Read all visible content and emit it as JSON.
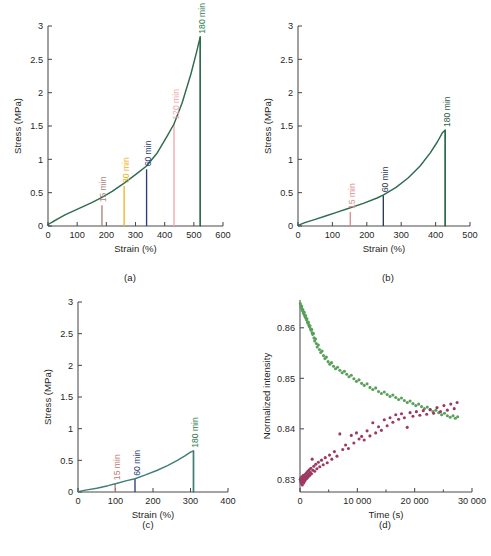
{
  "figure": {
    "background": "#ffffff",
    "panels": [
      "a",
      "b",
      "c",
      "d"
    ]
  },
  "captions": {
    "a": "(a)",
    "b": "(b)",
    "c": "(c)",
    "d": "(d)"
  },
  "colors": {
    "curve_green": "#2f6b4f",
    "curve_teal": "#3f7f78",
    "t15": "#a8847e",
    "t15_b": "#d98d8d",
    "t15_c": "#c07a74",
    "t30": "#f0b323",
    "t60": "#2c3d77",
    "t60_b": "#2a3a52",
    "t120": "#f2a7ad",
    "t180": "#2f7d4f",
    "t180_b": "#2f5d4a",
    "scatter_green": "#59a05a",
    "scatter_magenta": "#9c3a63",
    "axis": "#4a4a4a"
  },
  "chart_data": [
    {
      "id": "a",
      "type": "line",
      "title": "",
      "xlabel": "Strain (%)",
      "ylabel": "Stress (MPa)",
      "xlim": [
        0,
        600
      ],
      "ylim": [
        0,
        3
      ],
      "xticks": [
        0,
        100,
        200,
        300,
        400,
        500,
        600
      ],
      "xticklabels": [
        "0",
        "100",
        "200",
        "300",
        "400",
        "500",
        "600"
      ],
      "yticks": [
        0,
        0.5,
        1,
        1.5,
        2,
        2.5,
        3
      ],
      "yticklabels": [
        "0",
        "0.5",
        "1",
        "1.5",
        "2",
        "2.5",
        "3"
      ],
      "grid": false,
      "legend": "none",
      "series": [
        {
          "name": "stress-strain master curve",
          "color": "#2f6b4f",
          "x": [
            0,
            15,
            35,
            60,
            90,
            120,
            150,
            185,
            220,
            260,
            300,
            338,
            375,
            410,
            432,
            460,
            490,
            510,
            522
          ],
          "y": [
            0.02,
            0.06,
            0.11,
            0.17,
            0.23,
            0.29,
            0.35,
            0.43,
            0.52,
            0.64,
            0.77,
            0.9,
            1.1,
            1.36,
            1.53,
            1.85,
            2.28,
            2.62,
            2.84
          ]
        }
      ],
      "drop_x": 522,
      "annotations": [
        {
          "label": "15 min",
          "x": 185,
          "y": 0.31,
          "color": "#a8847e"
        },
        {
          "label": "30 min",
          "x": 261,
          "y": 0.6,
          "color": "#f0b323"
        },
        {
          "label": "60 min",
          "x": 338,
          "y": 0.85,
          "color": "#2c3d77"
        },
        {
          "label": "120 min",
          "x": 432,
          "y": 1.55,
          "color": "#f2a7ad"
        },
        {
          "label": "180 min",
          "x": 522,
          "y": 2.84,
          "color": "#2f7d4f"
        }
      ]
    },
    {
      "id": "b",
      "type": "line",
      "title": "",
      "xlabel": "Strain (%)",
      "ylabel": "Stress (MPa)",
      "xlim": [
        0,
        500
      ],
      "ylim": [
        0,
        3
      ],
      "xticks": [
        0,
        100,
        200,
        300,
        400,
        500
      ],
      "xticklabels": [
        "0",
        "100",
        "200",
        "300",
        "400",
        "500"
      ],
      "yticks": [
        0,
        0.5,
        1,
        1.5,
        2,
        2.5,
        3
      ],
      "yticklabels": [
        "0",
        "0.5",
        "1",
        "1.5",
        "2",
        "2.5",
        "3"
      ],
      "grid": false,
      "legend": "none",
      "series": [
        {
          "name": "stress-strain master curve",
          "color": "#2f6b4f",
          "x": [
            0,
            20,
            50,
            80,
            110,
            150,
            190,
            230,
            250,
            285,
            320,
            355,
            385,
            405,
            420,
            428
          ],
          "y": [
            0.01,
            0.05,
            0.1,
            0.15,
            0.2,
            0.27,
            0.34,
            0.42,
            0.47,
            0.58,
            0.72,
            0.9,
            1.1,
            1.26,
            1.4,
            1.44
          ]
        }
      ],
      "drop_x": 428,
      "annotations": [
        {
          "label": "15 min",
          "x": 152,
          "y": 0.21,
          "color": "#d98d8d"
        },
        {
          "label": "60 min",
          "x": 248,
          "y": 0.46,
          "color": "#2a3a52"
        },
        {
          "label": "180 min",
          "x": 428,
          "y": 1.44,
          "color": "#2f5d4a"
        }
      ]
    },
    {
      "id": "c",
      "type": "line",
      "title": "",
      "xlabel": "Strain (%)",
      "ylabel": "Stress (MPa)",
      "xlim": [
        0,
        400
      ],
      "ylim": [
        0,
        3
      ],
      "xticks": [
        0,
        100,
        200,
        300,
        400
      ],
      "xticklabels": [
        "0",
        "100",
        "200",
        "300",
        "400"
      ],
      "yticks": [
        0,
        0.5,
        1,
        1.5,
        2,
        2.5,
        3
      ],
      "yticklabels": [
        "0",
        "0.5",
        "1",
        "1.5",
        "2",
        "2.5",
        "3"
      ],
      "grid": false,
      "legend": "none",
      "series": [
        {
          "name": "stress-strain master curve",
          "color": "#3f7f78",
          "x": [
            0,
            20,
            50,
            80,
            100,
            130,
            152,
            180,
            210,
            240,
            265,
            285,
            300,
            308
          ],
          "y": [
            0.005,
            0.03,
            0.06,
            0.1,
            0.13,
            0.18,
            0.21,
            0.27,
            0.34,
            0.42,
            0.5,
            0.57,
            0.63,
            0.65
          ]
        }
      ],
      "drop_x": 308,
      "annotations": [
        {
          "label": "15 min",
          "x": 99,
          "y": 0.14,
          "color": "#c07a74"
        },
        {
          "label": "60 min",
          "x": 152,
          "y": 0.21,
          "color": "#2c3d77"
        },
        {
          "label": "180 min",
          "x": 308,
          "y": 0.65,
          "color": "#2f7d4f"
        }
      ]
    },
    {
      "id": "d",
      "type": "scatter",
      "title": "",
      "xlabel": "Time (s)",
      "ylabel": "Normalized intensity",
      "xlim": [
        0,
        30000
      ],
      "ylim": [
        0.8275,
        0.8655
      ],
      "xticks": [
        0,
        10000,
        20000,
        30000
      ],
      "xticklabels": [
        "0",
        "10 000",
        "20 000",
        "30 000"
      ],
      "yticks": [
        0.83,
        0.84,
        0.85,
        0.86
      ],
      "yticklabels": [
        "0.83",
        "0.84",
        "0.85",
        "0.86"
      ],
      "grid": false,
      "legend": "none",
      "series": [
        {
          "name": "decaying band",
          "color": "#59a05a",
          "points": [
            [
              60,
              0.8648
            ],
            [
              130,
              0.8644
            ],
            [
              200,
              0.864
            ],
            [
              280,
              0.8643
            ],
            [
              350,
              0.8637
            ],
            [
              420,
              0.8634
            ],
            [
              500,
              0.8636
            ],
            [
              580,
              0.863
            ],
            [
              650,
              0.8628
            ],
            [
              730,
              0.8631
            ],
            [
              810,
              0.8625
            ],
            [
              890,
              0.8622
            ],
            [
              970,
              0.8624
            ],
            [
              1050,
              0.8619
            ],
            [
              1130,
              0.8616
            ],
            [
              1210,
              0.8618
            ],
            [
              1300,
              0.8612
            ],
            [
              1390,
              0.8609
            ],
            [
              1470,
              0.8611
            ],
            [
              1560,
              0.8605
            ],
            [
              1650,
              0.8602
            ],
            [
              1740,
              0.8604
            ],
            [
              1830,
              0.8598
            ],
            [
              1930,
              0.8595
            ],
            [
              2020,
              0.8597
            ],
            [
              2120,
              0.859
            ],
            [
              2220,
              0.8587
            ],
            [
              2330,
              0.8589
            ],
            [
              2440,
              0.858
            ],
            [
              2560,
              0.8574
            ],
            [
              2700,
              0.8578
            ],
            [
              2850,
              0.8569
            ],
            [
              3000,
              0.8562
            ],
            [
              3200,
              0.8566
            ],
            [
              3400,
              0.8557
            ],
            [
              3620,
              0.8551
            ],
            [
              3850,
              0.8554
            ],
            [
              4100,
              0.8545
            ],
            [
              4350,
              0.8539
            ],
            [
              4600,
              0.8542
            ],
            [
              4900,
              0.8533
            ],
            [
              5200,
              0.8528
            ],
            [
              5500,
              0.8531
            ],
            [
              5850,
              0.8524
            ],
            [
              6200,
              0.8519
            ],
            [
              6550,
              0.8522
            ],
            [
              6950,
              0.8516
            ],
            [
              7350,
              0.8511
            ],
            [
              7750,
              0.8514
            ],
            [
              8150,
              0.8508
            ],
            [
              8550,
              0.8503
            ],
            [
              8950,
              0.8506
            ],
            [
              9400,
              0.8499
            ],
            [
              9850,
              0.8494
            ],
            [
              10300,
              0.8497
            ],
            [
              10750,
              0.849
            ],
            [
              11200,
              0.8486
            ],
            [
              11700,
              0.8489
            ],
            [
              12200,
              0.8482
            ],
            [
              12700,
              0.8478
            ],
            [
              13200,
              0.8481
            ],
            [
              13700,
              0.8474
            ],
            [
              14200,
              0.847
            ],
            [
              14700,
              0.8473
            ],
            [
              15200,
              0.8468
            ],
            [
              15700,
              0.8464
            ],
            [
              16200,
              0.8467
            ],
            [
              16700,
              0.8462
            ],
            [
              17200,
              0.8458
            ],
            [
              17700,
              0.8461
            ],
            [
              18200,
              0.8456
            ],
            [
              18700,
              0.8452
            ],
            [
              19200,
              0.8455
            ],
            [
              19700,
              0.845
            ],
            [
              20200,
              0.8446
            ],
            [
              20700,
              0.8449
            ],
            [
              21200,
              0.8444
            ],
            [
              21700,
              0.844
            ],
            [
              22200,
              0.8443
            ],
            [
              22700,
              0.8438
            ],
            [
              23200,
              0.8434
            ],
            [
              23700,
              0.8437
            ],
            [
              24200,
              0.8432
            ],
            [
              24700,
              0.8428
            ],
            [
              25200,
              0.8431
            ],
            [
              25700,
              0.8426
            ],
            [
              26200,
              0.8423
            ],
            [
              26700,
              0.8426
            ],
            [
              27100,
              0.8421
            ],
            [
              27500,
              0.8424
            ]
          ]
        },
        {
          "name": "rising band",
          "color": "#9c3a63",
          "points": [
            [
              50,
              0.83
            ],
            [
              110,
              0.8296
            ],
            [
              170,
              0.8303
            ],
            [
              230,
              0.8292
            ],
            [
              290,
              0.8299
            ],
            [
              350,
              0.8305
            ],
            [
              410,
              0.8289
            ],
            [
              470,
              0.8302
            ],
            [
              530,
              0.8296
            ],
            [
              590,
              0.8308
            ],
            [
              650,
              0.8293
            ],
            [
              710,
              0.8301
            ],
            [
              780,
              0.8306
            ],
            [
              850,
              0.8297
            ],
            [
              920,
              0.831
            ],
            [
              990,
              0.83
            ],
            [
              1060,
              0.8304
            ],
            [
              1130,
              0.8313
            ],
            [
              1200,
              0.8302
            ],
            [
              1280,
              0.8308
            ],
            [
              1360,
              0.8316
            ],
            [
              1440,
              0.8305
            ],
            [
              1520,
              0.8311
            ],
            [
              1610,
              0.8319
            ],
            [
              1700,
              0.8308
            ],
            [
              1800,
              0.8314
            ],
            [
              1900,
              0.8322
            ],
            [
              2000,
              0.8311
            ],
            [
              2120,
              0.834
            ],
            [
              2250,
              0.8318
            ],
            [
              2400,
              0.8326
            ],
            [
              2560,
              0.8316
            ],
            [
              2750,
              0.833
            ],
            [
              2950,
              0.8321
            ],
            [
              3200,
              0.8334
            ],
            [
              3450,
              0.8325
            ],
            [
              3750,
              0.8338
            ],
            [
              4050,
              0.8329
            ],
            [
              4400,
              0.8343
            ],
            [
              4750,
              0.8333
            ],
            [
              5150,
              0.8348
            ],
            [
              5550,
              0.834
            ],
            [
              6000,
              0.8355
            ],
            [
              6450,
              0.8346
            ],
            [
              6950,
              0.839
            ],
            [
              7450,
              0.8359
            ],
            [
              7950,
              0.8368
            ],
            [
              8450,
              0.8361
            ],
            [
              8950,
              0.8387
            ],
            [
              9400,
              0.8372
            ],
            [
              9850,
              0.8392
            ],
            [
              10300,
              0.838
            ],
            [
              10750,
              0.8385
            ],
            [
              11200,
              0.8378
            ],
            [
              11700,
              0.8396
            ],
            [
              12200,
              0.8386
            ],
            [
              12700,
              0.8412
            ],
            [
              13200,
              0.8392
            ],
            [
              13700,
              0.8404
            ],
            [
              14200,
              0.8397
            ],
            [
              14700,
              0.8418
            ],
            [
              15200,
              0.8406
            ],
            [
              15700,
              0.8422
            ],
            [
              16200,
              0.8413
            ],
            [
              16700,
              0.8428
            ],
            [
              17200,
              0.8419
            ],
            [
              17700,
              0.843
            ],
            [
              18200,
              0.8422
            ],
            [
              18700,
              0.8403
            ],
            [
              19200,
              0.8432
            ],
            [
              19700,
              0.8425
            ],
            [
              20300,
              0.8434
            ],
            [
              20900,
              0.8427
            ],
            [
              21500,
              0.8436
            ],
            [
              22100,
              0.8429
            ],
            [
              22700,
              0.8438
            ],
            [
              23300,
              0.8431
            ],
            [
              23900,
              0.8442
            ],
            [
              24500,
              0.8434
            ],
            [
              25100,
              0.8446
            ],
            [
              25700,
              0.8437
            ],
            [
              26300,
              0.8449
            ],
            [
              26900,
              0.844
            ],
            [
              27400,
              0.8452
            ]
          ]
        }
      ]
    }
  ]
}
